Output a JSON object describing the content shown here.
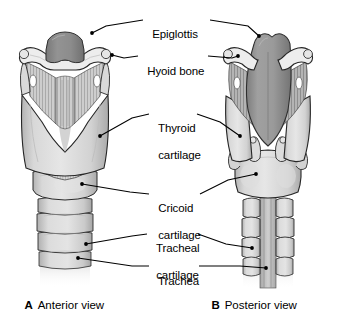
{
  "figure": {
    "background": "#ffffff",
    "line_color": "#000000",
    "palette": {
      "bone_light": "#e9e9e9",
      "cartilage_light": "#dcdcdc",
      "cartilage_mid": "#c8c8c8",
      "membrane": "#bdbdbd",
      "epiglottis_dark": "#8d8d8d",
      "posterior_dark": "#9a9a9a",
      "shadow": "#a5a5a5",
      "outline": "#1a1a1a"
    }
  },
  "labels": [
    {
      "id": "epiglottis",
      "text": "Epiglottis",
      "text2": "",
      "x": 146,
      "y": 14
    },
    {
      "id": "hyoid-bone",
      "text": "Hyoid bone",
      "text2": "",
      "x": 141,
      "y": 51
    },
    {
      "id": "thyroid-cartilage",
      "text": "Thyroid",
      "text2": "cartilage",
      "x": 152,
      "y": 108
    },
    {
      "id": "cricoid-cartilage",
      "text": "Cricoid",
      "text2": "cartilage",
      "x": 152,
      "y": 188
    },
    {
      "id": "tracheal-cartilage",
      "text": "Tracheal",
      "text2": "cartilage",
      "x": 150,
      "y": 228
    },
    {
      "id": "trachea",
      "text": "Trachea",
      "text2": "",
      "x": 152,
      "y": 261
    }
  ],
  "captions": [
    {
      "id": "caption-a",
      "letter": "A",
      "text": "Anterior view",
      "x": 18,
      "y": 287
    },
    {
      "id": "caption-b",
      "letter": "B",
      "text": "Posterior view",
      "x": 205,
      "y": 287
    }
  ],
  "views": {
    "anterior": {
      "id": "anterior-view-diagram",
      "name": "Anterior view of larynx"
    },
    "posterior": {
      "id": "posterior-view-diagram",
      "name": "Posterior view of larynx"
    }
  },
  "structures": [
    {
      "id": "epiglottis-anterior",
      "name": "epiglottis"
    },
    {
      "id": "hyoid-bone-anterior",
      "name": "hyoid bone"
    },
    {
      "id": "thyrohyoid-membrane-anterior",
      "name": "thyrohyoid membrane"
    },
    {
      "id": "thyroid-cartilage-anterior",
      "name": "thyroid cartilage"
    },
    {
      "id": "cricothyroid-ligament",
      "name": "cricothyroid ligament"
    },
    {
      "id": "cricoid-cartilage-anterior",
      "name": "cricoid cartilage"
    },
    {
      "id": "tracheal-rings-anterior",
      "name": "tracheal cartilage rings"
    },
    {
      "id": "epiglottis-posterior",
      "name": "epiglottis"
    },
    {
      "id": "hyoid-bone-posterior",
      "name": "hyoid bone"
    },
    {
      "id": "thyroid-cartilage-posterior",
      "name": "thyroid cartilage"
    },
    {
      "id": "arytenoid-cartilages",
      "name": "arytenoid cartilages"
    },
    {
      "id": "cricoid-lamina",
      "name": "cricoid cartilage lamina"
    },
    {
      "id": "tracheal-rings-posterior",
      "name": "tracheal cartilage rings"
    },
    {
      "id": "trachealis-membrane",
      "name": "posterior tracheal membrane"
    }
  ]
}
